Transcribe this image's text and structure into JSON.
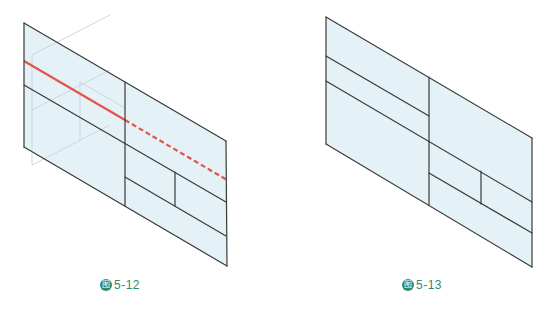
{
  "colors": {
    "fill": "#e4f1f6",
    "stroke": "#3a3a3a",
    "ghost": "#c9d9e0",
    "red": "#e0574a",
    "caption": "#2f8a6f"
  },
  "figures": [
    {
      "id": "fig-5-12",
      "caption": {
        "badge": "图",
        "number": "5-12",
        "x": 100,
        "y": 278
      },
      "panels": [
        {
          "points": "24,23 125,82 125,206 24,147"
        },
        {
          "points": "125,82 226,141 227,266 125,206"
        }
      ],
      "lines": [
        {
          "name": "left-outer-edge",
          "x1": 24,
          "y1": 23,
          "x2": 24,
          "y2": 147
        },
        {
          "name": "top-edge",
          "x1": 24,
          "y1": 23,
          "x2": 226,
          "y2": 141
        },
        {
          "name": "bottom-edge",
          "x1": 24,
          "y1": 147,
          "x2": 227,
          "y2": 266
        },
        {
          "name": "center-fold",
          "x1": 125,
          "y1": 82,
          "x2": 125,
          "y2": 206
        },
        {
          "name": "right-outer-edge",
          "x1": 226,
          "y1": 141,
          "x2": 227,
          "y2": 266
        },
        {
          "name": "long-divider",
          "x1": 24,
          "y1": 85,
          "x2": 226,
          "y2": 202
        },
        {
          "name": "lower-divider",
          "x1": 125,
          "y1": 177,
          "x2": 226,
          "y2": 236
        },
        {
          "name": "short-vertical",
          "x1": 175,
          "y1": 172,
          "x2": 175,
          "y2": 206
        }
      ],
      "ghost_lines": [
        {
          "x1": 32,
          "y1": 55,
          "x2": 32,
          "y2": 165
        },
        {
          "x1": 32,
          "y1": 55,
          "x2": 110,
          "y2": 15
        },
        {
          "x1": 32,
          "y1": 110,
          "x2": 110,
          "y2": 70
        },
        {
          "x1": 32,
          "y1": 165,
          "x2": 110,
          "y2": 125
        },
        {
          "x1": 80,
          "y1": 82,
          "x2": 80,
          "y2": 140
        },
        {
          "x1": 80,
          "y1": 82,
          "x2": 125,
          "y2": 108
        }
      ],
      "red_solid": {
        "x1": 24,
        "y1": 61,
        "x2": 125,
        "y2": 120
      },
      "red_dashed": {
        "x1": 125,
        "y1": 120,
        "x2": 227,
        "y2": 180
      }
    },
    {
      "id": "fig-5-13",
      "caption": {
        "badge": "图",
        "number": "5-13",
        "x": 402,
        "y": 278
      },
      "panels": [
        {
          "points": "326,17 429,77 429,205 326,144"
        },
        {
          "points": "429,77 532,138 532,267 429,205"
        }
      ],
      "lines": [
        {
          "name": "left-outer-edge",
          "x1": 326,
          "y1": 17,
          "x2": 326,
          "y2": 144
        },
        {
          "name": "top-edge",
          "x1": 326,
          "y1": 17,
          "x2": 532,
          "y2": 138
        },
        {
          "name": "bottom-edge",
          "x1": 326,
          "y1": 144,
          "x2": 532,
          "y2": 267
        },
        {
          "name": "center-fold",
          "x1": 429,
          "y1": 77,
          "x2": 429,
          "y2": 205
        },
        {
          "name": "right-outer-edge",
          "x1": 532,
          "y1": 138,
          "x2": 532,
          "y2": 267
        },
        {
          "name": "upper-divider",
          "x1": 326,
          "y1": 56,
          "x2": 429,
          "y2": 116
        },
        {
          "name": "long-divider",
          "x1": 326,
          "y1": 81,
          "x2": 532,
          "y2": 202
        },
        {
          "name": "lower-divider",
          "x1": 429,
          "y1": 173,
          "x2": 532,
          "y2": 233
        },
        {
          "name": "short-vertical",
          "x1": 481,
          "y1": 171,
          "x2": 481,
          "y2": 204
        }
      ],
      "ghost_lines": []
    }
  ]
}
